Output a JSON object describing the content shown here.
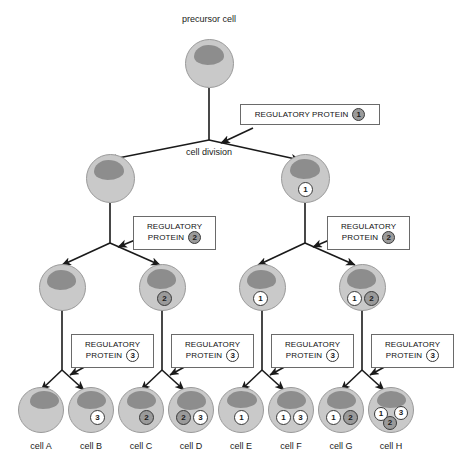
{
  "diagram": {
    "title_label": "precursor cell",
    "division_label": "cell division",
    "colors": {
      "cell_body": "#c9c9c9",
      "nucleus": "#8d8d8d",
      "marker_filled": "#9a9a9a",
      "marker_open": "#ffffff",
      "line": "#1a1a1a",
      "box_border": "#6a6a6a"
    }
  },
  "regulatory_boxes": [
    {
      "id": "rp1",
      "line1": "REGULATORY PROTEIN",
      "line2": "",
      "badge": "1",
      "style": "filled",
      "layout": "wide"
    },
    {
      "id": "rp2a",
      "line1": "REGULATORY",
      "line2": "PROTEIN",
      "badge": "2",
      "style": "filled",
      "layout": "two"
    },
    {
      "id": "rp2b",
      "line1": "REGULATORY",
      "line2": "PROTEIN",
      "badge": "2",
      "style": "filled",
      "layout": "two"
    },
    {
      "id": "rp3a",
      "line1": "REGULATORY",
      "line2": "PROTEIN",
      "badge": "3",
      "style": "open",
      "layout": "two"
    },
    {
      "id": "rp3b",
      "line1": "REGULATORY",
      "line2": "PROTEIN",
      "badge": "3",
      "style": "open",
      "layout": "two"
    },
    {
      "id": "rp3c",
      "line1": "REGULATORY",
      "line2": "PROTEIN",
      "badge": "3",
      "style": "open",
      "layout": "two"
    },
    {
      "id": "rp3d",
      "line1": "REGULATORY",
      "line2": "PROTEIN",
      "badge": "3",
      "style": "open",
      "layout": "two"
    }
  ],
  "generations": [
    {
      "name": "generation-0",
      "cells": [
        {
          "id": "precursor",
          "label": "precursor cell",
          "markers": []
        }
      ]
    },
    {
      "name": "generation-1",
      "cells": [
        {
          "id": "g1-left",
          "label": "",
          "markers": []
        },
        {
          "id": "g1-right",
          "label": "",
          "markers": [
            {
              "value": "1",
              "style": "open"
            }
          ]
        }
      ]
    },
    {
      "name": "generation-2",
      "cells": [
        {
          "id": "g2-c1",
          "label": "",
          "markers": []
        },
        {
          "id": "g2-c2",
          "label": "",
          "markers": [
            {
              "value": "2",
              "style": "filled"
            }
          ]
        },
        {
          "id": "g2-c3",
          "label": "",
          "markers": [
            {
              "value": "1",
              "style": "open"
            }
          ]
        },
        {
          "id": "g2-c4",
          "label": "",
          "markers": [
            {
              "value": "1",
              "style": "open"
            },
            {
              "value": "2",
              "style": "filled"
            }
          ]
        }
      ]
    },
    {
      "name": "generation-3",
      "cells": [
        {
          "id": "cellA",
          "label": "cell A",
          "markers": []
        },
        {
          "id": "cellB",
          "label": "cell B",
          "markers": [
            {
              "value": "3",
              "style": "open"
            }
          ]
        },
        {
          "id": "cellC",
          "label": "cell C",
          "markers": [
            {
              "value": "2",
              "style": "filled"
            }
          ]
        },
        {
          "id": "cellD",
          "label": "cell D",
          "markers": [
            {
              "value": "2",
              "style": "filled"
            },
            {
              "value": "3",
              "style": "open"
            }
          ]
        },
        {
          "id": "cellE",
          "label": "cell E",
          "markers": [
            {
              "value": "1",
              "style": "open"
            }
          ]
        },
        {
          "id": "cellF",
          "label": "cell F",
          "markers": [
            {
              "value": "1",
              "style": "open"
            },
            {
              "value": "3",
              "style": "open"
            }
          ]
        },
        {
          "id": "cellG",
          "label": "cell G",
          "markers": [
            {
              "value": "1",
              "style": "open"
            },
            {
              "value": "2",
              "style": "filled"
            }
          ]
        },
        {
          "id": "cellH",
          "label": "cell H",
          "markers": [
            {
              "value": "1",
              "style": "open"
            },
            {
              "value": "3",
              "style": "open"
            },
            {
              "value": "2",
              "style": "filled"
            }
          ]
        }
      ]
    }
  ]
}
